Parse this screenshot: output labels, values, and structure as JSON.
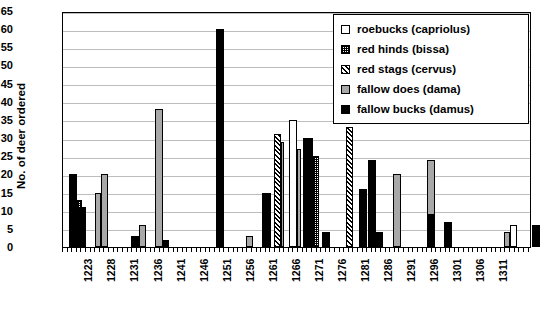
{
  "chart_data": {
    "type": "bar",
    "title": "",
    "subtitle": "",
    "xlabel": "",
    "ylabel": "No. of deer ordered",
    "ylim": [
      0,
      65
    ],
    "ytick_step": 5,
    "yticks": [
      0,
      5,
      10,
      15,
      20,
      25,
      30,
      35,
      40,
      45,
      50,
      55,
      60,
      65
    ],
    "grid": "horizontal",
    "legend_position": "top-right",
    "categories": [
      "1223",
      "1228",
      "1231",
      "1236",
      "1241",
      "1246",
      "1251",
      "1256",
      "1261",
      "1266",
      "1271",
      "1276",
      "1281",
      "1286",
      "1291",
      "1296",
      "1301",
      "1306",
      "1311"
    ],
    "series": [
      {
        "name": "roebucks (capriolus)",
        "color": "#ffffff",
        "pattern": "solid-white",
        "values": [
          0,
          0,
          0,
          0,
          0,
          0,
          0,
          35,
          0,
          0,
          0,
          0,
          0,
          0,
          0,
          6,
          0,
          0,
          0
        ]
      },
      {
        "name": "red hinds (bissa)",
        "color": "#ffffff",
        "pattern": "fine-grid",
        "values": [
          13,
          0,
          0,
          0,
          0,
          0,
          0,
          0,
          25,
          0,
          0,
          0,
          0,
          0,
          0,
          0,
          0,
          0,
          0
        ]
      },
      {
        "name": "red stags (cervus)",
        "color": "#ffffff",
        "pattern": "diagonal-hatch",
        "values": [
          0,
          0,
          0,
          0,
          0,
          0,
          0,
          31,
          0,
          33,
          0,
          0,
          0,
          0,
          0,
          0,
          0,
          0,
          30
        ]
      },
      {
        "name": "fallow does (dama)",
        "color": "#a8a8a8",
        "pattern": "solid-gray",
        "values": [
          0,
          15,
          6,
          38,
          0,
          0,
          3,
          0,
          0,
          0,
          0,
          20,
          24,
          0,
          0,
          4,
          0,
          0,
          0
        ]
      },
      {
        "name": "fallow bucks (damus)",
        "color": "#000000",
        "pattern": "solid-black",
        "values": [
          20,
          20,
          3,
          2,
          0,
          60,
          15,
          15,
          30,
          4,
          24,
          3,
          7,
          0,
          0,
          0,
          6,
          0,
          40
        ]
      }
    ],
    "bars": [
      {
        "category": "1223",
        "series": "fallow bucks (damus)",
        "value": 20
      },
      {
        "category": "1223",
        "series": "red hinds (bissa)",
        "value": 13
      },
      {
        "category": "1223",
        "series": "fallow bucks (damus)",
        "value": 11
      },
      {
        "category": "1228",
        "series": "fallow does (dama)",
        "value": 15
      },
      {
        "category": "1228",
        "series": "fallow does (dama)",
        "value": 20
      },
      {
        "category": "1231",
        "series": "fallow bucks (damus)",
        "value": 3
      },
      {
        "category": "1231",
        "series": "fallow does (dama)",
        "value": 6
      },
      {
        "category": "1236",
        "series": "fallow does (dama)",
        "value": 38
      },
      {
        "category": "1236",
        "series": "fallow bucks (damus)",
        "value": 2
      },
      {
        "category": "1246",
        "series": "fallow bucks (damus)",
        "value": 60
      },
      {
        "category": "1251",
        "series": "fallow does (dama)",
        "value": 3
      },
      {
        "category": "1254",
        "series": "fallow bucks (damus)",
        "value": 15
      },
      {
        "category": "1256",
        "series": "red stags (cervus)",
        "value": 31
      },
      {
        "category": "1256",
        "series": "roebucks (capriolus)",
        "value": 35
      },
      {
        "category": "1261",
        "series": "fallow bucks (damus)",
        "value": 30
      },
      {
        "category": "1261",
        "series": "red hinds (bissa)",
        "value": 25
      },
      {
        "category": "1263",
        "series": "fallow bucks (damus)",
        "value": 4
      },
      {
        "category": "1266",
        "series": "red stags (cervus)",
        "value": 33
      },
      {
        "category": "1270",
        "series": "fallow bucks (damus)",
        "value": 16
      },
      {
        "category": "1271",
        "series": "fallow bucks (damus)",
        "value": 24
      },
      {
        "category": "1272",
        "series": "fallow bucks (damus)",
        "value": 4
      },
      {
        "category": "1276",
        "series": "fallow does (dama)",
        "value": 20
      },
      {
        "category": "1281",
        "series": "fallow does (dama)",
        "value": 24
      },
      {
        "category": "1283",
        "series": "fallow bucks (damus)",
        "value": 7
      },
      {
        "category": "1296",
        "series": "fallow does (dama)",
        "value": 4
      },
      {
        "category": "1296",
        "series": "roebucks (capriolus)",
        "value": 6
      },
      {
        "category": "1301",
        "series": "fallow bucks (damus)",
        "value": 6
      },
      {
        "category": "1311",
        "series": "red stags (cervus)",
        "value": 30
      },
      {
        "category": "1311",
        "series": "fallow bucks (damus)",
        "value": 12
      },
      {
        "category": "1311",
        "series": "fallow bucks (damus)",
        "value": 40
      }
    ]
  },
  "legend": {
    "items": [
      {
        "label": "roebucks (capriolus)",
        "swatch": "sw-roebucks"
      },
      {
        "label": "red hinds (bissa)",
        "swatch": "sw-redhinds"
      },
      {
        "label": "red stags (cervus)",
        "swatch": "sw-redstags"
      },
      {
        "label": "fallow does (dama)",
        "swatch": "sw-fallowdoes"
      },
      {
        "label": "fallow bucks (damus)",
        "swatch": "sw-fallowbucks"
      }
    ]
  },
  "render": {
    "bar_layout": [
      {
        "x": 6,
        "w": 8,
        "v": 20,
        "cls": "sw-fallowbucks"
      },
      {
        "x": 14,
        "w": 5,
        "v": 13,
        "cls": "sw-redhinds"
      },
      {
        "x": 14,
        "w": 9,
        "v": 11,
        "cls": "sw-fallowbucks"
      },
      {
        "x": 32,
        "w": 6,
        "v": 15,
        "cls": "sw-fallowdoes"
      },
      {
        "x": 38,
        "w": 7,
        "v": 20,
        "cls": "sw-fallowdoes"
      },
      {
        "x": 68,
        "w": 8,
        "v": 3,
        "cls": "sw-fallowbucks"
      },
      {
        "x": 76,
        "w": 7,
        "v": 6,
        "cls": "sw-fallowdoes"
      },
      {
        "x": 92,
        "w": 8,
        "v": 38,
        "cls": "sw-fallowdoes"
      },
      {
        "x": 100,
        "w": 6,
        "v": 2,
        "cls": "sw-fallowbucks"
      },
      {
        "x": 153,
        "w": 8,
        "v": 60,
        "cls": "sw-fallowbucks"
      },
      {
        "x": 183,
        "w": 7,
        "v": 3,
        "cls": "sw-fallowdoes"
      },
      {
        "x": 199,
        "w": 9,
        "v": 15,
        "cls": "sw-fallowbucks"
      },
      {
        "x": 211,
        "w": 7,
        "v": 31,
        "cls": "sw-redstags"
      },
      {
        "x": 218,
        "w": 3,
        "v": 29,
        "cls": "sw-fallowdoes"
      },
      {
        "x": 226,
        "w": 8,
        "v": 35,
        "cls": "sw-roebucks"
      },
      {
        "x": 234,
        "w": 4,
        "v": 27,
        "cls": "sw-fallowdoes"
      },
      {
        "x": 240,
        "w": 10,
        "v": 30,
        "cls": "sw-fallowbucks"
      },
      {
        "x": 250,
        "w": 6,
        "v": 25,
        "cls": "sw-redhinds"
      },
      {
        "x": 259,
        "w": 8,
        "v": 4,
        "cls": "sw-fallowbucks"
      },
      {
        "x": 283,
        "w": 7,
        "v": 33,
        "cls": "sw-redstags"
      },
      {
        "x": 296,
        "w": 8,
        "v": 16,
        "cls": "sw-fallowbucks"
      },
      {
        "x": 305,
        "w": 8,
        "v": 24,
        "cls": "sw-fallowbucks"
      },
      {
        "x": 313,
        "w": 7,
        "v": 4,
        "cls": "sw-fallowbucks"
      },
      {
        "x": 330,
        "w": 8,
        "v": 20,
        "cls": "sw-fallowdoes"
      },
      {
        "x": 364,
        "w": 8,
        "v": 24,
        "cls": "sw-fallowdoes"
      },
      {
        "x": 364,
        "w": 8,
        "v": 9,
        "cls": "sw-fallowbucks"
      },
      {
        "x": 381,
        "w": 8,
        "v": 7,
        "cls": "sw-fallowbucks"
      },
      {
        "x": 441,
        "w": 6,
        "v": 4,
        "cls": "sw-fallowdoes"
      },
      {
        "x": 447,
        "w": 7,
        "v": 6,
        "cls": "sw-roebucks"
      },
      {
        "x": 469,
        "w": 8,
        "v": 6,
        "cls": "sw-fallowbucks"
      },
      {
        "x": 512,
        "w": 8,
        "v": 30,
        "cls": "sw-redstags"
      },
      {
        "x": 520,
        "w": 8,
        "v": 12,
        "cls": "sw-fallowbucks"
      },
      {
        "x": 531,
        "w": 9,
        "v": 40,
        "cls": "sw-fallowbucks"
      }
    ]
  }
}
